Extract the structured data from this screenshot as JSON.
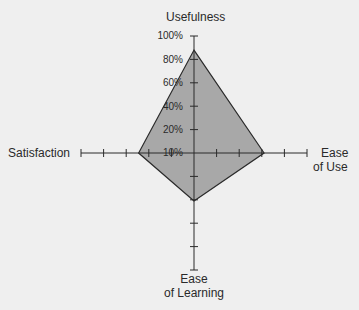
{
  "chart_data": {
    "type": "radar",
    "title": "",
    "axes": [
      "Usefulness",
      "Ease of Use",
      "Ease of Learning",
      "Satisfaction"
    ],
    "axis_labels": {
      "top": "Usefulness",
      "right_line1": "Ease",
      "right_line2": "of Use",
      "bottom_line1": "Ease",
      "bottom_line2": "of Learning",
      "left": "Satisfaction"
    },
    "tick_labels": [
      "100%",
      "80%",
      "60%",
      "40%",
      "20%",
      "10%"
    ],
    "range": [
      0,
      100
    ],
    "ticks_per_axis": 5,
    "series": [
      {
        "name": "Score",
        "values": {
          "Usefulness": 88,
          "Ease of Use": 62,
          "Ease of Learning": 41,
          "Satisfaction": 49
        }
      }
    ],
    "colors": {
      "background": "#efefef",
      "fill": "#a8a8a8",
      "stroke": "#2a2a2a",
      "axis": "#2a2a2a"
    },
    "grid": false,
    "legend": null
  }
}
